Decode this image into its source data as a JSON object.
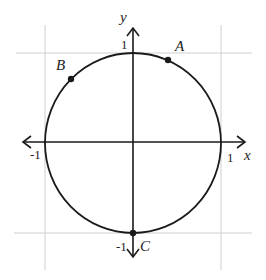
{
  "diagram": {
    "type": "unit-circle",
    "axes": {
      "x_label": "x",
      "y_label": "y",
      "ticks": {
        "x_pos": "1",
        "x_neg": "-1",
        "y_pos": "1",
        "y_neg": "-1"
      }
    },
    "points": [
      {
        "label": "A",
        "description": "point on circle in quadrant I near top"
      },
      {
        "label": "B",
        "description": "point on circle in quadrant II"
      },
      {
        "label": "C",
        "description": "point at (0, -1)"
      }
    ],
    "colors": {
      "stroke": "#1a1a1a",
      "grid": "#c8c8c8",
      "background": "#ffffff"
    }
  }
}
